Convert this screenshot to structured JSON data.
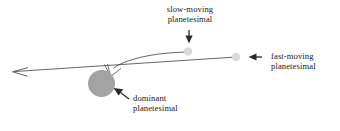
{
  "figure": {
    "background_color": "#ffffff",
    "line_color": "#3d3d3d",
    "text_color": "#1a1a1a"
  },
  "labels": {
    "slow": {
      "line1": "slow-moving",
      "line2": "planetesimal"
    },
    "fast": {
      "line1": "fast-moving",
      "line2": "planetesimal"
    },
    "dominant": {
      "line1": "dominant",
      "line2": "planetesimal"
    }
  },
  "bodies": {
    "dominant_planetesimal": {
      "cx": 101.5,
      "cy": 83.5,
      "r": 13.5,
      "color": "#a3a3a3"
    },
    "slow_planetesimal": {
      "cx": 188,
      "cy": 51.5,
      "r": 4.2,
      "color": "#d9d9d9"
    },
    "fast_planetesimal": {
      "cx": 236,
      "cy": 57,
      "r": 4.2,
      "color": "#dcdcdc"
    }
  },
  "paths": {
    "fast_trajectory": {
      "description": "straight line from fast planetesimal leftward past dominant planetesimal to open arrowhead",
      "start": [
        236,
        57
      ],
      "end": [
        13,
        72
      ]
    },
    "slow_trajectory": {
      "description": "curved line from slow planetesimal bending down-left into deflection point",
      "start": [
        188,
        52
      ],
      "end": [
        108,
        69
      ]
    },
    "deflection": {
      "description": "V-shaped deflection wedge above dominant planetesimal",
      "apex": [
        110,
        76
      ]
    }
  },
  "pointers": {
    "slow_arrow": {
      "direction": "down",
      "tip": [
        189,
        43
      ]
    },
    "fast_arrow": {
      "direction": "left",
      "tip": [
        248,
        57
      ]
    },
    "dominant_arrow": {
      "direction": "up-left",
      "tip": [
        113,
        88
      ]
    }
  }
}
